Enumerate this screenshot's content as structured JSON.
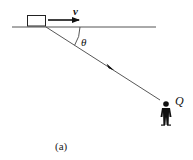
{
  "diagram": {
    "caption": "(a)",
    "labels": {
      "velocity": "v",
      "angle": "θ",
      "observer": "Q"
    },
    "colors": {
      "stroke": "#333333",
      "fill": "#111111",
      "background": "#ffffff"
    },
    "elements": {
      "ground_line": {
        "x1": 12,
        "y1": 27,
        "x2": 156,
        "y2": 27
      },
      "block": {
        "x": 27,
        "y": 15,
        "width": 19,
        "height": 11
      },
      "velocity_arrow": {
        "x1": 48,
        "y1": 20,
        "x2": 80,
        "y2": 20
      },
      "sight_line": {
        "x1": 46,
        "y1": 27,
        "x2": 160,
        "y2": 100
      },
      "observer_position": {
        "x": 166,
        "y": 113
      }
    }
  }
}
